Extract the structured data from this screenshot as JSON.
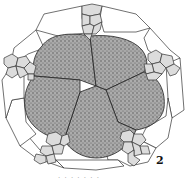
{
  "figure": {
    "label": "2",
    "caption_fragment": "· · ·  · · · ·",
    "colors": {
      "outline": "#333333",
      "outer_cell_fill": "#ffffff",
      "small_cell_fill": "#d9d9d9",
      "central_cell_fill": "#9a9a9a",
      "background": "#ffffff"
    }
  }
}
